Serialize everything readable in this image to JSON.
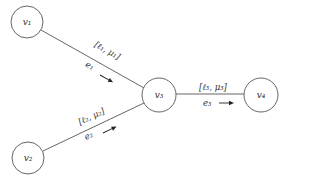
{
  "diagram": {
    "type": "directed-graph",
    "nodes": [
      {
        "id": "v1",
        "label": "v₁",
        "cx": 27,
        "cy": 22,
        "r": 16
      },
      {
        "id": "v2",
        "label": "v₂",
        "cx": 28,
        "cy": 158,
        "r": 16
      },
      {
        "id": "v3",
        "label": "v₃",
        "cx": 159,
        "cy": 95,
        "r": 17
      },
      {
        "id": "v4",
        "label": "v₄",
        "cx": 261,
        "cy": 95,
        "r": 17
      }
    ],
    "edges": [
      {
        "id": "e1",
        "from": "v1",
        "to": "v3",
        "name": "e₁",
        "param": "[ℓ₁, μ₁]"
      },
      {
        "id": "e2",
        "from": "v2",
        "to": "v3",
        "name": "e₂",
        "param": "[ℓ₂, μ₂]"
      },
      {
        "id": "e3",
        "from": "v3",
        "to": "v4",
        "name": "e₃",
        "param": "[ℓ₃, μ₃]"
      }
    ]
  },
  "colors": {
    "stroke": "#555555",
    "text": "#333333",
    "arrow": "#222222",
    "background": "#ffffff"
  }
}
